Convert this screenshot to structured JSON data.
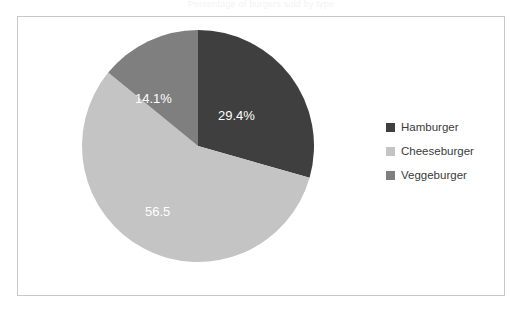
{
  "top_clipped_title": "Percentage of burgers sold by type",
  "legend": {
    "position": "right",
    "items": [
      {
        "label": "Hamburger",
        "color": "#3f3f3f",
        "swatch_name": "legend-swatch-hamburger"
      },
      {
        "label": "Cheeseburger",
        "color": "#c4c4c4",
        "swatch_name": "legend-swatch-cheeseburger"
      },
      {
        "label": "Veggeburger",
        "color": "#7f7f7f",
        "swatch_name": "legend-swatch-veggeburger"
      }
    ]
  },
  "slice_labels": {
    "hamburger": "29.4%",
    "cheeseburger": "56.5",
    "veggeburger": "14.1%"
  },
  "chart_data": {
    "type": "pie",
    "title": "",
    "xlabel": "",
    "ylabel": "",
    "grid": false,
    "legend_position": "right",
    "start_angle_deg": 0,
    "direction": "clockwise",
    "categories": [
      "Hamburger",
      "Cheeseburger",
      "Veggeburger"
    ],
    "values": [
      29.4,
      56.5,
      14.1
    ],
    "value_unit": "percent",
    "data_labels": [
      "29.4%",
      "56.5",
      "14.1%"
    ],
    "colors": [
      "#3f3f3f",
      "#c4c4c4",
      "#7f7f7f"
    ],
    "data_label_color": "#ffffff",
    "slices": [
      {
        "name": "Hamburger",
        "value": 29.4,
        "label": "29.4%",
        "color": "#3f3f3f"
      },
      {
        "name": "Cheeseburger",
        "value": 56.5,
        "label": "56.5",
        "color": "#c4c4c4"
      },
      {
        "name": "Veggeburger",
        "value": 14.1,
        "label": "14.1%",
        "color": "#7f7f7f"
      }
    ]
  }
}
